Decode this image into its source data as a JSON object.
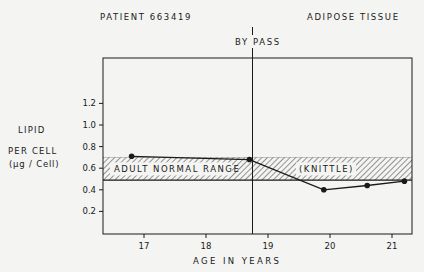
{
  "header": {
    "patient_label": "PATIENT 663419",
    "tissue_label": "ADIPOSE TISSUE",
    "event_label": "BY PASS"
  },
  "axes": {
    "ylabel_lines": [
      "LIPID",
      "PER CELL",
      "(µg / Cell)"
    ],
    "xlabel": "AGE IN YEARS"
  },
  "band": {
    "label": "ADULT NORMAL RANGE",
    "source": "(KNITTLE)"
  },
  "chart_data": {
    "type": "line",
    "xlabel": "AGE IN YEARS",
    "ylabel": "LIPID PER CELL (µg / Cell)",
    "xlim": [
      16.35,
      21.35
    ],
    "ylim": [
      0,
      1.4
    ],
    "xticks": [
      17,
      18,
      19,
      20,
      21
    ],
    "yticks": [
      0.2,
      0.4,
      0.6,
      0.8,
      1.0,
      1.2
    ],
    "ytick_labels": [
      "0.2",
      "0.4",
      "0.6",
      "0.8",
      "1.0",
      "1.2"
    ],
    "grid": false,
    "legend": "none",
    "series": [
      {
        "name": "Patient 663419 lipid per cell",
        "x": [
          16.8,
          18.7,
          19.9,
          20.6,
          21.2
        ],
        "y": [
          0.71,
          0.68,
          0.4,
          0.44,
          0.48
        ],
        "marker": "filled-circle"
      }
    ],
    "annotations": [
      {
        "type": "vline",
        "x": 18.75,
        "label": "BY PASS"
      },
      {
        "type": "hband",
        "y0": 0.49,
        "y1": 0.7,
        "label": "ADULT NORMAL RANGE (KNITTLE)",
        "fill": "hatched"
      }
    ]
  },
  "colors": {
    "ink": "#1a1a1a",
    "paper": "#f4f4f2"
  }
}
